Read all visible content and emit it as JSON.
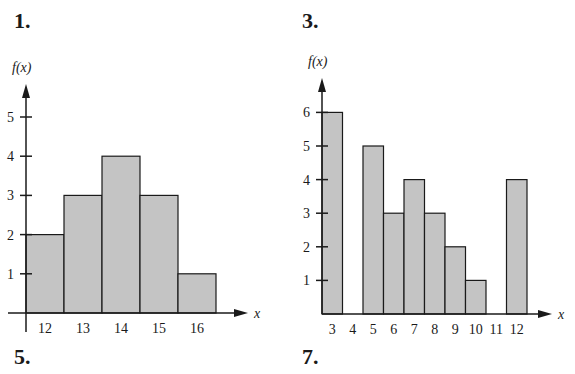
{
  "labels": {
    "p1": "1.",
    "p3": "3.",
    "p5": "5.",
    "p7": "7."
  },
  "colors": {
    "bar_fill": "#c4c4c4",
    "stroke": "#1a1a1a"
  },
  "chart_data": [
    {
      "type": "bar",
      "title": "1.",
      "xlabel": "x",
      "ylabel": "f(x)",
      "categories": [
        "12",
        "13",
        "14",
        "15",
        "16"
      ],
      "values": [
        2,
        3,
        4,
        3,
        1
      ],
      "yticks": [
        1,
        2,
        3,
        4,
        5
      ],
      "ylim": [
        0,
        5.5
      ],
      "grid": false
    },
    {
      "type": "bar",
      "title": "3.",
      "xlabel": "x",
      "ylabel": "f(x)",
      "categories": [
        "3",
        "4",
        "5",
        "6",
        "7",
        "8",
        "9",
        "10",
        "11",
        "12"
      ],
      "values": [
        6,
        0,
        5,
        3,
        4,
        3,
        2,
        1,
        0,
        4
      ],
      "yticks": [
        1,
        2,
        3,
        4,
        5,
        6
      ],
      "ylim": [
        0,
        6.5
      ],
      "grid": false
    }
  ]
}
